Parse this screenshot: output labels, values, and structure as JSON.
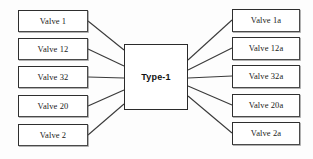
{
  "diagram": {
    "background_color": "#fdfdfd",
    "line_color": "#3a3a3a",
    "box_border_color": "#4a4a4a",
    "center": {
      "label": "Type-1",
      "x": 124,
      "y": 44,
      "width": 64,
      "height": 66
    },
    "left_nodes": [
      {
        "label": "Valve 1",
        "x": 18,
        "y": 10,
        "width": 70,
        "height": 22,
        "link_y": 21
      },
      {
        "label": "Valve 12",
        "x": 18,
        "y": 38,
        "width": 70,
        "height": 22,
        "link_y": 49
      },
      {
        "label": "Valve 32",
        "x": 18,
        "y": 66,
        "width": 70,
        "height": 22,
        "link_y": 77
      },
      {
        "label": "Valve 20",
        "x": 18,
        "y": 95,
        "width": 70,
        "height": 22,
        "link_y": 106
      },
      {
        "label": "Valve 2",
        "x": 18,
        "y": 124,
        "width": 70,
        "height": 22,
        "link_y": 135
      }
    ],
    "right_nodes": [
      {
        "label": "Valve 1a",
        "x": 232,
        "y": 9,
        "width": 68,
        "height": 23,
        "link_y": 20
      },
      {
        "label": "Valve 12a",
        "x": 232,
        "y": 37,
        "width": 68,
        "height": 23,
        "link_y": 48
      },
      {
        "label": "Valve 32a",
        "x": 232,
        "y": 65,
        "width": 68,
        "height": 23,
        "link_y": 76
      },
      {
        "label": "Valve 20a",
        "x": 232,
        "y": 94,
        "width": 68,
        "height": 23,
        "link_y": 105
      },
      {
        "label": "Valve 2a",
        "x": 232,
        "y": 122,
        "width": 68,
        "height": 23,
        "link_y": 133
      }
    ],
    "left_connectors": [
      {
        "x1": 88,
        "y1": 21,
        "x2": 124,
        "y2": 50
      },
      {
        "x1": 88,
        "y1": 49,
        "x2": 124,
        "y2": 66
      },
      {
        "x1": 88,
        "y1": 77,
        "x2": 124,
        "y2": 78
      },
      {
        "x1": 88,
        "y1": 106,
        "x2": 124,
        "y2": 90
      },
      {
        "x1": 88,
        "y1": 135,
        "x2": 124,
        "y2": 104
      }
    ],
    "right_connectors": [
      {
        "x1": 188,
        "y1": 60,
        "x2": 232,
        "y2": 20
      },
      {
        "x1": 188,
        "y1": 70,
        "x2": 232,
        "y2": 48
      },
      {
        "x1": 188,
        "y1": 78,
        "x2": 232,
        "y2": 76
      },
      {
        "x1": 188,
        "y1": 86,
        "x2": 232,
        "y2": 105
      },
      {
        "x1": 188,
        "y1": 96,
        "x2": 232,
        "y2": 133
      }
    ]
  }
}
